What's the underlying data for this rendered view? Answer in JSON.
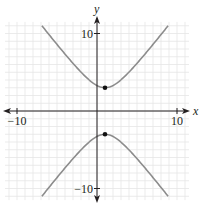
{
  "chart_data": {
    "type": "line",
    "title": "",
    "xlabel": "x",
    "ylabel": "y",
    "xlim": [
      -10,
      10
    ],
    "ylim": [
      -10,
      10
    ],
    "grid": true,
    "x_tick_labels": [
      {
        "value": -10,
        "label": "−10"
      },
      {
        "value": 10,
        "label": "10"
      }
    ],
    "y_tick_labels": [
      {
        "value": 10,
        "label": "10"
      },
      {
        "value": -10,
        "label": "−10"
      }
    ],
    "series": [
      {
        "name": "hyperbola",
        "equation": "y^2/9 - (x-1)^2/5 = 1",
        "center": [
          1,
          0
        ],
        "a": 3,
        "b_squared": 5,
        "orientation": "vertical",
        "branches": [
          "upper",
          "lower"
        ],
        "y_extent": 11
      }
    ],
    "points": [
      {
        "name": "upper-vertex",
        "x": 1,
        "y": 3
      },
      {
        "name": "lower-vertex",
        "x": 1,
        "y": -3
      }
    ]
  },
  "colors": {
    "curve": "#8c8c8c",
    "axis": "#231f20",
    "grid": "#e6e6e6",
    "point": "#111111"
  }
}
